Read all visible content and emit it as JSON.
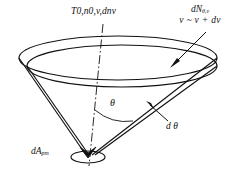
{
  "figure": {
    "name": "molecular-beam-cone-diagram",
    "background": "#ffffff",
    "stroke": "#111111",
    "labels": {
      "top_axis": {
        "main": "T",
        "sub1": "0",
        "mid": ",n",
        "sub2": "0",
        "mid2": ",v,d",
        "tail": "n",
        "sub3": "v"
      },
      "top_axis_plain": "T0,n0,v,dnv",
      "flux": {
        "line1_main": "dN",
        "line1_sub": "θ,v",
        "line2": "v ~ v + dv"
      },
      "angle": "θ",
      "angle_increment": "d θ",
      "area_element": {
        "main": "dA",
        "sub": "pm"
      },
      "area_element_plain": "dApm"
    },
    "geometry": {
      "apex_x": 88,
      "apex_y": 156,
      "rim_center_x": 118,
      "rim_center_y": 63,
      "rim_rx": 98,
      "rim_ry": 22,
      "axis_top_y": 26,
      "axis_bottom_y": 166,
      "angle_arc_degrees": 38
    },
    "colors": {
      "ink": "#111111",
      "paper": "#ffffff"
    }
  }
}
